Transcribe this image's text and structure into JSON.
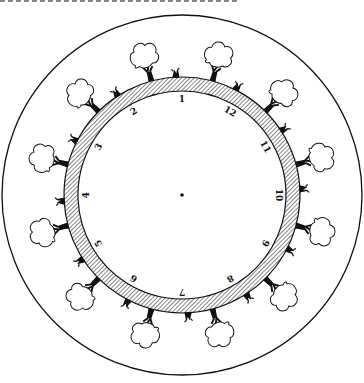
{
  "diagram": {
    "title": "",
    "center": [
      182,
      195
    ],
    "outer_circle_radius": 180,
    "ring_outer_radius": 118,
    "ring_inner_radius": 104,
    "numbers": [
      {
        "label": "1",
        "angle": 0
      },
      {
        "label": "2",
        "angle": -30
      },
      {
        "label": "3",
        "angle": -60
      },
      {
        "label": "4",
        "angle": -90
      },
      {
        "label": "5",
        "angle": -120
      },
      {
        "label": "6",
        "angle": -150
      },
      {
        "label": "7",
        "angle": 180
      },
      {
        "label": "8",
        "angle": 150
      },
      {
        "label": "9",
        "angle": 120
      },
      {
        "label": "10",
        "angle": 90
      },
      {
        "label": "11",
        "angle": 60
      },
      {
        "label": "12",
        "angle": 30
      }
    ],
    "trees_count": 12,
    "colors": {
      "ink": "#111111",
      "paper": "#ffffff"
    }
  }
}
